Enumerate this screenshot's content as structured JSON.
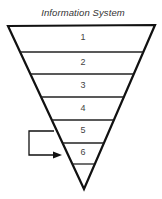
{
  "diagram": {
    "title": "Information System",
    "levels": [
      {
        "label": "1"
      },
      {
        "label": "2"
      },
      {
        "label": "3"
      },
      {
        "label": "4"
      },
      {
        "label": "5"
      },
      {
        "label": "6"
      }
    ],
    "arrow": {
      "from_level": "5",
      "to_level": "6"
    },
    "colors": {
      "stroke": "#111111",
      "text": "#444444",
      "background": "#ffffff"
    }
  }
}
